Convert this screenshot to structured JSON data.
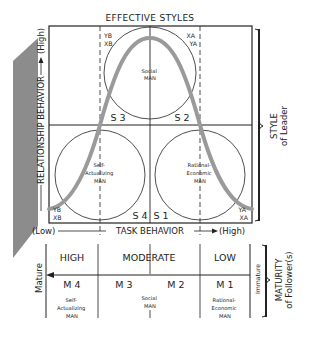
{
  "title": "EFFECTIVE STYLES",
  "axes": {
    "y_label": "RELATIONSHIP BEHAVIOR",
    "y_high": "(High)",
    "y_low": "(Low)",
    "x_label": "TASK BEHAVIOR",
    "x_high": "(High)"
  },
  "quadrants": {
    "s3": "S 3",
    "s2": "S 2",
    "s4": "S 4",
    "s1": "S 1"
  },
  "corner_codes": {
    "top_left": [
      "YB",
      "XB"
    ],
    "top_right": [
      "XA",
      "YA"
    ],
    "bottom_left": [
      "YB",
      "XB"
    ],
    "bottom_right": [
      "YA",
      "XA"
    ]
  },
  "circles": {
    "top": [
      "Social",
      "MAN"
    ],
    "bottom_left": [
      "Self-",
      "Actualizing",
      "MAN"
    ],
    "bottom_right": [
      "Rational-",
      "Economic",
      "MAN"
    ]
  },
  "style_brace": {
    "line1": "STYLE",
    "line2": "of Leader"
  },
  "maturity": {
    "levels": [
      "HIGH",
      "MODERATE",
      "LOW"
    ],
    "codes": [
      "M 4",
      "M 3",
      "M 2",
      "M 1"
    ],
    "men": {
      "m4": [
        "Self-",
        "Actualizing",
        "MAN"
      ],
      "middle": [
        "Social",
        "MAN"
      ],
      "m1": [
        "Rational-",
        "Economic",
        "MAN"
      ]
    },
    "left_label": "Mature",
    "right_label": "Immature",
    "brace_line1": "MATURITY",
    "brace_line2": "of Follower(s)"
  },
  "colors": {
    "ink": "#222222",
    "curve": "#9a9a9a",
    "shade": "#8c8c8c"
  }
}
